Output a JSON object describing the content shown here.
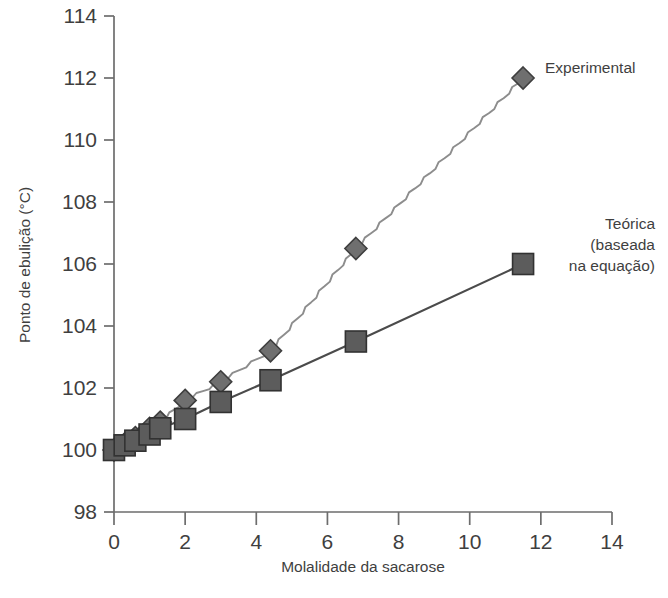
{
  "chart_data": {
    "type": "line",
    "title": "",
    "subtitle": "",
    "xlabel": "Molalidade da sacarose",
    "ylabel": "Ponto de ebulição (°C)",
    "xlim": [
      0,
      14
    ],
    "ylim": [
      98,
      114
    ],
    "xticks": [
      0,
      2,
      4,
      6,
      8,
      10,
      12,
      14
    ],
    "xtick_labels": [
      "0",
      "2",
      "4",
      "6",
      "8",
      "10",
      "12",
      "14"
    ],
    "yticks": [
      98,
      100,
      102,
      104,
      106,
      108,
      110,
      112,
      114
    ],
    "ytick_labels": [
      "98",
      "100",
      "102",
      "104",
      "106",
      "108",
      "110",
      "112",
      "114"
    ],
    "grid": false,
    "legend_position": "inline-right-annotations",
    "series": [
      {
        "name": "Experimental",
        "marker": "diamond",
        "color": "#6f6f6f",
        "line_color": "#8d8d8d",
        "line_style": "wavy",
        "x": [
          0,
          0.3,
          0.6,
          1.0,
          1.3,
          2.0,
          3.0,
          4.4,
          6.8,
          11.5
        ],
        "values": [
          100.0,
          100.2,
          100.4,
          100.7,
          100.9,
          101.6,
          102.2,
          103.2,
          106.5,
          112.0
        ]
      },
      {
        "name": "Teórica (baseada na equação)",
        "marker": "square",
        "color": "#5c5c5c",
        "line_color": "#4b4b4b",
        "line_style": "straight",
        "x": [
          0,
          0.3,
          0.6,
          1.0,
          1.3,
          2.0,
          3.0,
          4.4,
          6.8,
          11.5
        ],
        "values": [
          100.0,
          100.15,
          100.3,
          100.5,
          100.7,
          101.0,
          101.55,
          102.25,
          103.5,
          106.0
        ]
      }
    ],
    "annotations": [
      {
        "id": "experimental",
        "text": "Experimental",
        "lines": [
          "Experimental"
        ],
        "x": 11.5,
        "y": 112.0
      },
      {
        "id": "teorica",
        "text": "Teórica (baseada na equação)",
        "lines": [
          "Teórica",
          "(baseada",
          "na equação)"
        ],
        "x": 11.5,
        "y": 106.0
      }
    ]
  },
  "colors": {
    "background": "#ffffff",
    "axis": "#6d6d6d",
    "text": "#3f3f3f",
    "experimental_marker": "#6f6f6f",
    "theoretical_marker": "#5c5c5c"
  }
}
